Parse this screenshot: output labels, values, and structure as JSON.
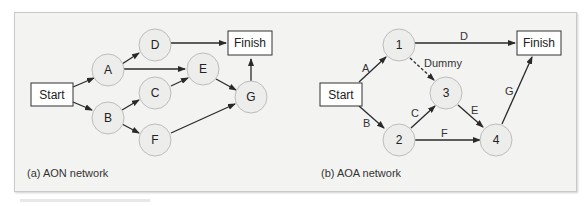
{
  "figure": {
    "aon": {
      "caption": "(a) AON network",
      "nodes": [
        {
          "id": "start",
          "label": "Start",
          "shape": "box"
        },
        {
          "id": "A",
          "label": "A",
          "shape": "circle"
        },
        {
          "id": "B",
          "label": "B",
          "shape": "circle"
        },
        {
          "id": "C",
          "label": "C",
          "shape": "circle"
        },
        {
          "id": "D",
          "label": "D",
          "shape": "circle"
        },
        {
          "id": "E",
          "label": "E",
          "shape": "circle"
        },
        {
          "id": "F",
          "label": "F",
          "shape": "circle"
        },
        {
          "id": "G",
          "label": "G",
          "shape": "circle"
        },
        {
          "id": "finish",
          "label": "Finish",
          "shape": "box"
        }
      ],
      "edges": [
        [
          "Start",
          "A"
        ],
        [
          "Start",
          "B"
        ],
        [
          "A",
          "D"
        ],
        [
          "A",
          "E"
        ],
        [
          "B",
          "C"
        ],
        [
          "B",
          "F"
        ],
        [
          "C",
          "E"
        ],
        [
          "D",
          "Finish"
        ],
        [
          "E",
          "G"
        ],
        [
          "F",
          "G"
        ],
        [
          "G",
          "Finish"
        ]
      ]
    },
    "aoa": {
      "caption": "(b) AOA network",
      "nodes": [
        {
          "id": "start",
          "label": "Start",
          "shape": "box"
        },
        {
          "id": "n1",
          "label": "1",
          "shape": "circle"
        },
        {
          "id": "n2",
          "label": "2",
          "shape": "circle"
        },
        {
          "id": "n3",
          "label": "3",
          "shape": "circle"
        },
        {
          "id": "n4",
          "label": "4",
          "shape": "circle"
        },
        {
          "id": "finish",
          "label": "Finish",
          "shape": "box"
        }
      ],
      "edges": [
        {
          "from": "Start",
          "to": "1",
          "label": "A"
        },
        {
          "from": "Start",
          "to": "2",
          "label": "B"
        },
        {
          "from": "2",
          "to": "3",
          "label": "C"
        },
        {
          "from": "1",
          "to": "Finish",
          "label": "D"
        },
        {
          "from": "3",
          "to": "4",
          "label": "E"
        },
        {
          "from": "2",
          "to": "4",
          "label": "F"
        },
        {
          "from": "4",
          "to": "Finish",
          "label": "G"
        },
        {
          "from": "1",
          "to": "3",
          "label": "Dummy",
          "dashed": true
        }
      ]
    }
  },
  "colors": {
    "panel_bg": "#f3f3f2",
    "node_fill": "#ededec",
    "node_stroke": "#bdbdbd",
    "arrow": "#2a2a2a"
  }
}
